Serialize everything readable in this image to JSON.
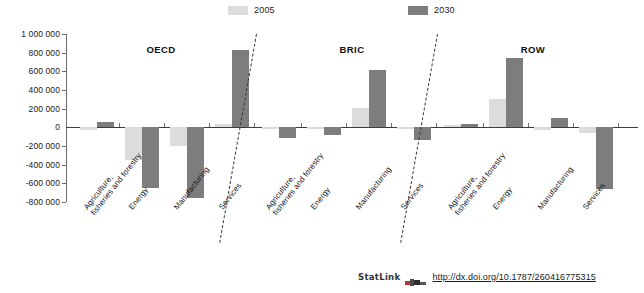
{
  "legend": {
    "entries": [
      {
        "label": "2005",
        "color": "#dcdcdc"
      },
      {
        "label": "2030",
        "color": "#7d7d7d"
      }
    ]
  },
  "axis": {
    "tick_labels": [
      "1 000 000",
      "800 000",
      "600 000",
      "400 000",
      "200 000",
      "0",
      "-200 000",
      "-400 000",
      "-600 000",
      "-800 000"
    ]
  },
  "groups": [
    {
      "title": "OECD"
    },
    {
      "title": "BRIC"
    },
    {
      "title": "ROW"
    }
  ],
  "categories": [
    {
      "line1": "Agriculture,",
      "line2": "fisheries and forestry"
    },
    {
      "line1": "Energy",
      "line2": ""
    },
    {
      "line1": "Manufacturing",
      "line2": ""
    },
    {
      "line1": "Services",
      "line2": ""
    }
  ],
  "footer": {
    "statlink": "StatLink",
    "url": "http://dx.doi.org/10.1787/260416775315"
  },
  "chart_data": {
    "type": "bar",
    "title": "",
    "xlabel": "",
    "ylabel": "",
    "ylim": [
      -800000,
      1000000
    ],
    "ytick_values": [
      1000000,
      800000,
      600000,
      400000,
      200000,
      0,
      -200000,
      -400000,
      -600000,
      -800000
    ],
    "grid": false,
    "legend_position": "top",
    "group_names": [
      "OECD",
      "BRIC",
      "ROW"
    ],
    "categories": [
      "Agriculture, fisheries and forestry",
      "Energy",
      "Manufacturing",
      "Services"
    ],
    "series": [
      {
        "name": "2005",
        "color": "#dcdcdc",
        "values_by_group": {
          "OECD": [
            -25000,
            -350000,
            -200000,
            35000
          ],
          "BRIC": [
            -5000,
            -5000,
            210000,
            -5000
          ],
          "ROW": [
            30000,
            300000,
            -30000,
            -60000
          ]
        }
      },
      {
        "name": "2030",
        "color": "#7d7d7d",
        "values_by_group": {
          "OECD": [
            60000,
            -650000,
            -760000,
            825000
          ],
          "BRIC": [
            -110000,
            -85000,
            610000,
            -140000
          ],
          "ROW": [
            35000,
            745000,
            100000,
            -660000
          ]
        }
      }
    ]
  }
}
